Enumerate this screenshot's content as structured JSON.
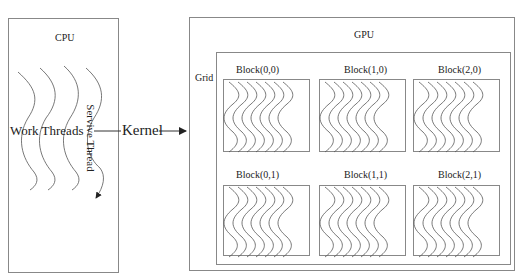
{
  "cpu": {
    "title": "CPU",
    "work_threads_label": "Work Threads",
    "service_thread_label": "Servive Thread"
  },
  "kernel_label": "Kernel",
  "gpu": {
    "title": "GPU",
    "grid_label": "Grid",
    "blocks": [
      {
        "label": "Block(0,0)"
      },
      {
        "label": "Block(1,0)"
      },
      {
        "label": "Block(2,0)"
      },
      {
        "label": "Block(0,1)"
      },
      {
        "label": "Block(1,1)"
      },
      {
        "label": "Block(2,1)"
      }
    ]
  },
  "colors": {
    "stroke": "#555555",
    "box": "#888888"
  }
}
